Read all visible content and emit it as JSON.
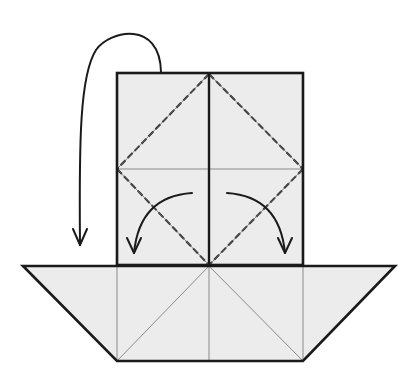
{
  "diagram": {
    "type": "origami-folding-instruction",
    "colors": {
      "paper_fill": "#ececec",
      "outline": "#1a1a1a",
      "crease": "#8a8a8a",
      "background": "#ffffff"
    },
    "parts": {
      "upper_panel": {
        "label": "upper rectangular panel",
        "x": 117,
        "y": 73,
        "w": 186,
        "h": 192
      },
      "lower_trapezoid": {
        "label": "lower trapezoid base",
        "top_y": 266,
        "bottom_y": 361,
        "top_x": [
          23,
          395
        ],
        "bottom_x": [
          117,
          303
        ]
      }
    },
    "arrows": [
      {
        "name": "fold-behind-arrow",
        "meaning": "fold top flap behind / down"
      },
      {
        "name": "fold-left-arrow",
        "meaning": "valley fold left triangle down"
      },
      {
        "name": "fold-right-arrow",
        "meaning": "valley fold right triangle down"
      }
    ],
    "fold_lines": [
      {
        "name": "valley-fold-upper-left",
        "style": "dashed"
      },
      {
        "name": "valley-fold-upper-right",
        "style": "dashed"
      },
      {
        "name": "valley-fold-lower-left",
        "style": "dashed"
      },
      {
        "name": "valley-fold-lower-right",
        "style": "dashed"
      }
    ]
  }
}
